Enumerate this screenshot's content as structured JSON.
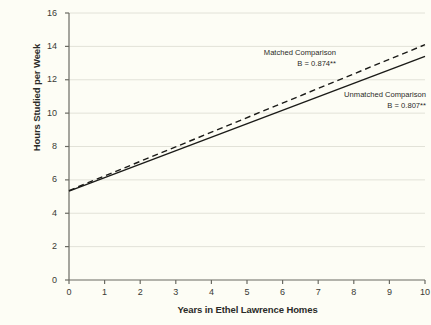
{
  "chart_data": {
    "type": "line",
    "title": "",
    "xlabel": "Years in Ethel Lawrence Homes",
    "ylabel": "Hours Studied per Week",
    "xlim": [
      0,
      10
    ],
    "ylim": [
      0,
      16
    ],
    "xticks": [
      "0",
      "1",
      "2",
      "3",
      "4",
      "5",
      "6",
      "7",
      "8",
      "9",
      "10"
    ],
    "yticks": [
      "0",
      "2",
      "4",
      "6",
      "8",
      "10",
      "12",
      "14",
      "16"
    ],
    "grid": "horizontal",
    "legend_position": "inline-annotations",
    "x": [
      0,
      10
    ],
    "series": [
      {
        "name": "Matched Comparison",
        "style": "dashed",
        "color": "#1b1b18",
        "slope": 0.874,
        "intercept": 5.36,
        "values": [
          5.36,
          14.1
        ],
        "annotation_label": "Matched Comparison",
        "annotation_stat": "B = 0.874**"
      },
      {
        "name": "Unmatched Comparison",
        "style": "solid",
        "color": "#1b1b18",
        "slope": 0.807,
        "intercept": 5.33,
        "values": [
          5.33,
          13.4
        ],
        "annotation_label": "Unmatched Comparison",
        "annotation_stat": "B = 0.807**"
      }
    ],
    "annotations": [
      {
        "label": "Matched Comparison",
        "stat": "B = 0.874**"
      },
      {
        "label": "Unmatched Comparison",
        "stat": "B = 0.807**"
      }
    ]
  },
  "colors": {
    "background": "#fdfdf5",
    "axis": "#6b6b63",
    "grid": "#e2e2d8",
    "text": "#2b2b28",
    "line": "#1b1b18"
  }
}
